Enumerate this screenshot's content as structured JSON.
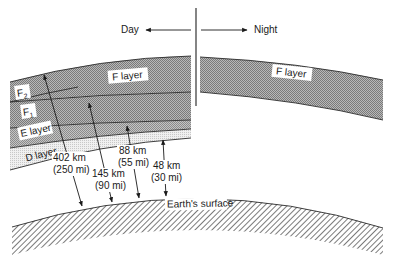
{
  "diagram": {
    "direction": {
      "day_label": "Day",
      "night_label": "Night"
    },
    "day_side": {
      "layers": [
        {
          "id": "F",
          "label": "F layer",
          "color": "#9a9a9a"
        },
        {
          "id": "F2",
          "label": "F",
          "sub": "2",
          "color": "#9a9a9a"
        },
        {
          "id": "F1",
          "label": "F",
          "sub": "1",
          "color": "#a6a6a6"
        },
        {
          "id": "E",
          "label": "E layer",
          "color": "#b0b0b0"
        },
        {
          "id": "D",
          "label": "D layer",
          "color": "#dcdcdc"
        }
      ]
    },
    "night_side": {
      "layers": [
        {
          "id": "F",
          "label": "F layer",
          "color": "#9a9a9a"
        }
      ]
    },
    "earth": {
      "label": "Earth's surface"
    },
    "heights": [
      {
        "km": "402 km",
        "mi": "(250 mi)",
        "layer": "F2"
      },
      {
        "km": "145 km",
        "mi": "(90 mi)",
        "layer": "F1"
      },
      {
        "km": "88 km",
        "mi": "(55 mi)",
        "layer": "E"
      },
      {
        "km": "48 km",
        "mi": "(30 mi)",
        "layer": "D"
      }
    ]
  }
}
